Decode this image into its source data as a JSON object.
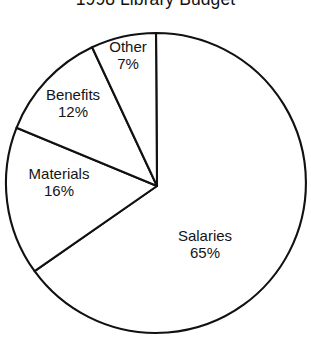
{
  "chart_data": {
    "type": "pie",
    "title": "1998 Library Budget",
    "subtitle": "",
    "xlabel": "",
    "ylabel": "",
    "grid": false,
    "legend": "none",
    "labels_inside_slices": true,
    "total_pct": 100,
    "units": "percent",
    "categories": [
      "Salaries",
      "Materials",
      "Benefits",
      "Other"
    ],
    "values": [
      65,
      16,
      12,
      7
    ],
    "slices": [
      {
        "name": "Salaries",
        "label": "Salaries",
        "value": 65,
        "pct_text": "65%",
        "fill": "#ffffff",
        "stroke": "#111111",
        "start_deg": 0,
        "end_deg": 234
      },
      {
        "name": "Materials",
        "label": "Materials",
        "value": 16,
        "pct_text": "16%",
        "fill": "#ffffff",
        "stroke": "#111111",
        "start_deg": 234,
        "end_deg": 291.6
      },
      {
        "name": "Benefits",
        "label": "Benefits",
        "value": 12,
        "pct_text": "12%",
        "fill": "#ffffff",
        "stroke": "#111111",
        "start_deg": 291.6,
        "end_deg": 334.8
      },
      {
        "name": "Other",
        "label": "Other",
        "value": 7,
        "pct_text": "7%",
        "fill": "#ffffff",
        "stroke": "#111111",
        "start_deg": 334.8,
        "end_deg": 360
      }
    ],
    "geometry": {
      "center_x": 156,
      "center_y": 183,
      "radius": 150,
      "vertex_x": 157,
      "vertex_y": 186
    }
  }
}
